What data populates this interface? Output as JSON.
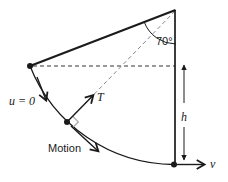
{
  "diagram": {
    "labels": {
      "angle": "70°",
      "initial_velocity": "u = 0",
      "tension": "T",
      "motion": "Motion",
      "height": "h",
      "velocity": "v"
    },
    "colors": {
      "line": "#1a1a1a",
      "muted_dash": "#888888",
      "right_angle_marker": "#aaaaaa",
      "background": "#ffffff"
    }
  }
}
